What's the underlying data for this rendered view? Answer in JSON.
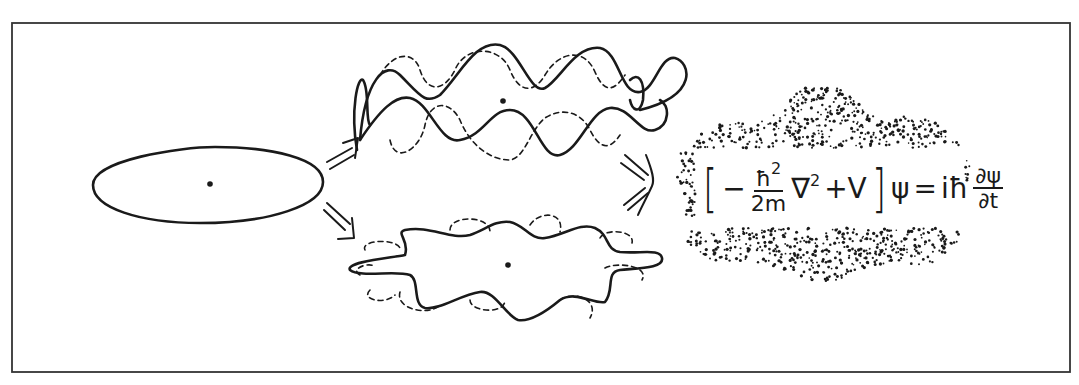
{
  "diagram": {
    "colors": {
      "ink": "#1a1a1a",
      "background": "#ffffff",
      "frame": "#333333"
    },
    "stages": [
      {
        "id": "classical-orbit",
        "shape": "ellipse",
        "label": ""
      },
      {
        "id": "helical-standing-wave",
        "shape": "wavy ring (3D, solid + dashed)",
        "label": ""
      },
      {
        "id": "planar-standing-wave",
        "shape": "wavy flattened ring (solid + dashed)",
        "label": ""
      },
      {
        "id": "probability-cloud",
        "shape": "dotted cloud",
        "label": ""
      }
    ],
    "arrows": [
      {
        "from": "classical-orbit",
        "to": "helical-standing-wave",
        "style": "double-line hand-drawn"
      },
      {
        "from": "classical-orbit",
        "to": "planar-standing-wave",
        "style": "double-line hand-drawn"
      },
      {
        "from": "standing-waves",
        "to": "probability-cloud",
        "style": "triple-line chevron"
      }
    ],
    "equation": {
      "open_bracket": "[",
      "minus": "−",
      "numerator": "ħ",
      "numerator_exp": "2",
      "denominator": "2m",
      "nabla": "∇",
      "nabla_exp": "2",
      "plus_v": "+V",
      "close_bracket": "]",
      "psi": "ψ",
      "equals": "=",
      "i_hbar": "iħ",
      "dpsi": "∂ψ",
      "dt": "∂t"
    }
  }
}
